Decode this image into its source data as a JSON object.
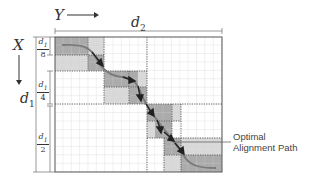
{
  "labels": {
    "y_axis": "Y",
    "x_axis": "X",
    "width_dim": "d2",
    "width_dim_sub": "2",
    "height_dim": "d1",
    "height_dim_sub": "1"
  },
  "fractions": [
    {
      "num": "d1",
      "den": "8"
    },
    {
      "num": "d1",
      "den": "4"
    },
    {
      "num": "d1",
      "den": "2"
    }
  ],
  "annotation": {
    "line1": "Optimal",
    "line2": "Alignment Path"
  },
  "colors": {
    "grid": "#c8c8c8",
    "border": "#555555",
    "dark_block": "#a9a9a9",
    "light_block": "#d6d6d6",
    "path": "#707070",
    "arrow": "#222222"
  }
}
